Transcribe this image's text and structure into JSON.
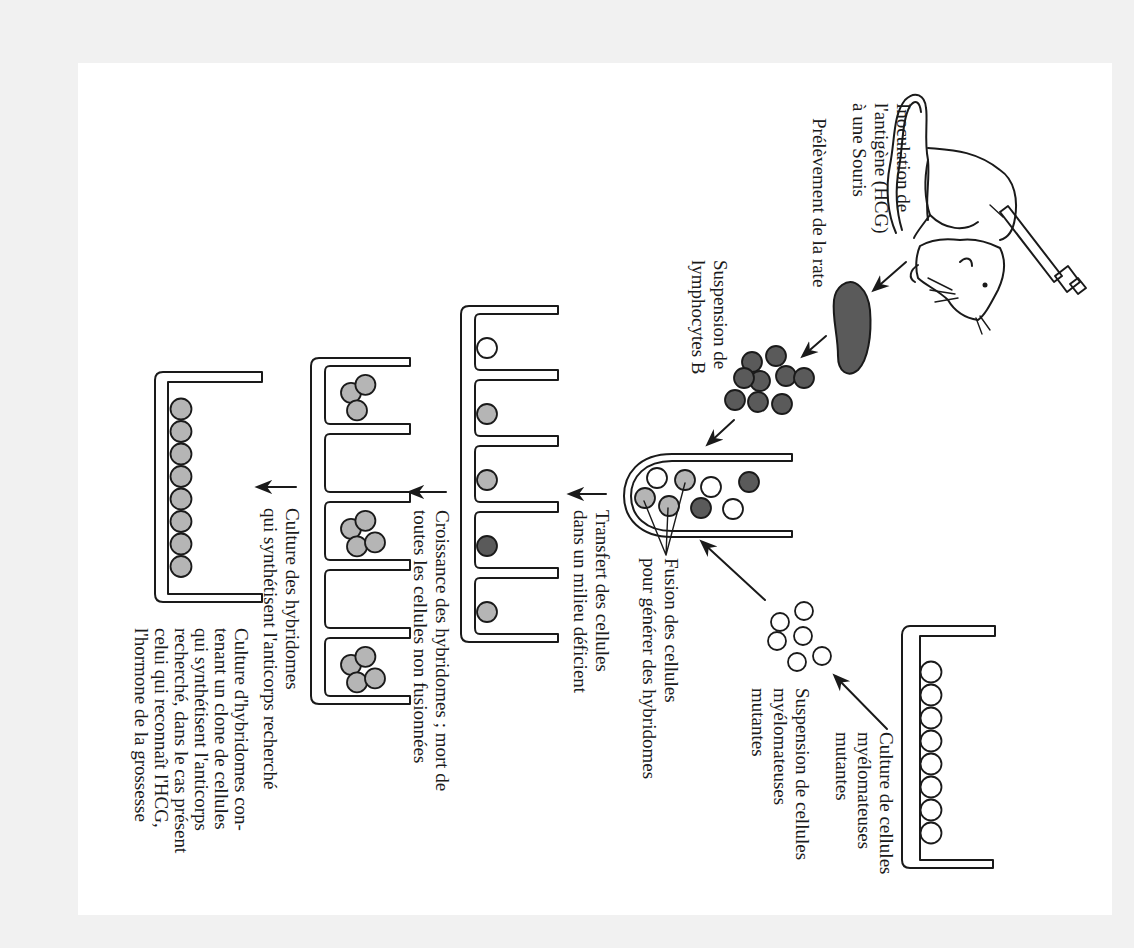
{
  "colors": {
    "page_background": "#f1f1f1",
    "panel_background": "#ffffff",
    "line": "#1a1a1a",
    "cell_lymphocyte": "#5a5a5a",
    "cell_hybridoma": "#b5b5b5",
    "cell_myeloma": "#ffffff"
  },
  "labels": {
    "inoculation": [
      "Inoculation de",
      "l'antigène (HCG)",
      "à une Souris"
    ],
    "prelevement": [
      "Prélèvement de la rate"
    ],
    "suspension_lymphocytes": [
      "Suspension de",
      "lymphocytes B"
    ],
    "culture_myelome": [
      "Culture de cellules",
      "myélomateuses",
      "mutantes"
    ],
    "suspension_myelome": [
      "Suspension de cellules",
      "myélomateuses",
      "mutantes"
    ],
    "fusion": [
      "Fusion des cellules",
      "pour générer des hybridomes"
    ],
    "transfert": [
      "Transfert des cellules",
      "dans un milieu déficient"
    ],
    "croissance": [
      "Croissance des hybridomes ; mort de",
      "toutes les cellules non fusionnées"
    ],
    "culture_hybridomes": [
      "Culture des hybridomes",
      "qui synthétisent l'anticorps recherché"
    ],
    "culture_clone": [
      "Culture d'hybridomes con-",
      "tenant un clone de cellules",
      "qui synthétisent l'anticorps",
      "recherché, dans le cas présent",
      "celui qui reconnaît l'HCG,",
      "l'hormone de la grossesse"
    ]
  },
  "diagram": {
    "steps": [
      "Inoculation de l'antigène (HCG) à une Souris",
      "Prélèvement de la rate",
      "Suspension de lymphocytes B",
      "Culture de cellules myélomateuses mutantes",
      "Suspension de cellules myélomateuses mutantes",
      "Fusion des cellules pour générer des hybridomes",
      "Transfert des cellules dans un milieu déficient",
      "Croissance des hybridomes ; mort de toutes les cellules non fusionnées",
      "Culture des hybridomes qui synthétisent l'anticorps recherché",
      "Culture d'hybridomes contenant un clone de cellules qui synthétisent l'anticorps recherché"
    ],
    "lymphocyte_cluster_count": 9,
    "myeloma_suspension_count": 6,
    "myeloma_culture_count": 8,
    "tube_cells": [
      "white",
      "hybrid",
      "white",
      "dark",
      "hybrid",
      "hybrid",
      "dark",
      "white"
    ],
    "plate1_wells": [
      "white",
      "hybrid",
      "hybrid",
      "dark",
      "hybrid"
    ],
    "plate2_wells": [
      3,
      0,
      4,
      0,
      4
    ],
    "final_culture_count": 8
  }
}
